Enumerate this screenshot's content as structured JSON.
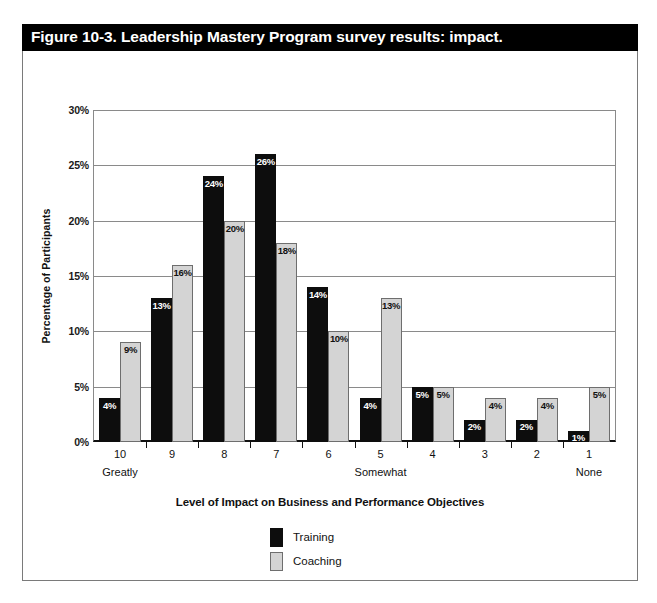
{
  "figure": {
    "title": "Figure 10-3. Leadership Mastery Program survey results: impact.",
    "title_bar_color": "#000000",
    "frame_border_color": "#7a7a7a",
    "background": "#ffffff"
  },
  "chart_data": {
    "type": "bar",
    "title": "Figure 10-3. Leadership Mastery Program survey results: impact.",
    "categories": [
      "10",
      "9",
      "8",
      "7",
      "6",
      "5",
      "4",
      "3",
      "2",
      "1"
    ],
    "category_sublabels": [
      "Greatly",
      "",
      "",
      "",
      "",
      "Somewhat",
      "",
      "",
      "",
      "None"
    ],
    "series": [
      {
        "name": "Training",
        "color": "#0d0d0d",
        "values": [
          4,
          13,
          24,
          26,
          14,
          4,
          5,
          2,
          2,
          1
        ]
      },
      {
        "name": "Coaching",
        "color": "#d4d4d4",
        "values": [
          9,
          16,
          20,
          18,
          10,
          13,
          5,
          4,
          4,
          5
        ]
      }
    ],
    "value_labels": {
      "Training": [
        "4%",
        "13%",
        "24%",
        "26%",
        "14%",
        "4%",
        "5%",
        "2%",
        "2%",
        "1%"
      ],
      "Coaching": [
        "9%",
        "16%",
        "20%",
        "18%",
        "10%",
        "13%",
        "5%",
        "4%",
        "4%",
        "5%"
      ]
    },
    "xlabel": "Level of Impact on Business and Performance Objectives",
    "ylabel": "Percentage of Participants",
    "ylim": [
      0,
      30
    ],
    "ytick_values": [
      0,
      5,
      10,
      15,
      20,
      25,
      30
    ],
    "ytick_labels": [
      "0%",
      "5%",
      "10%",
      "15%",
      "20%",
      "25%",
      "30%"
    ],
    "grid": "horizontal",
    "legend_position": "bottom-center",
    "legend": [
      {
        "label": "Training",
        "color": "#0d0d0d"
      },
      {
        "label": "Coaching",
        "color": "#d4d4d4"
      }
    ]
  }
}
